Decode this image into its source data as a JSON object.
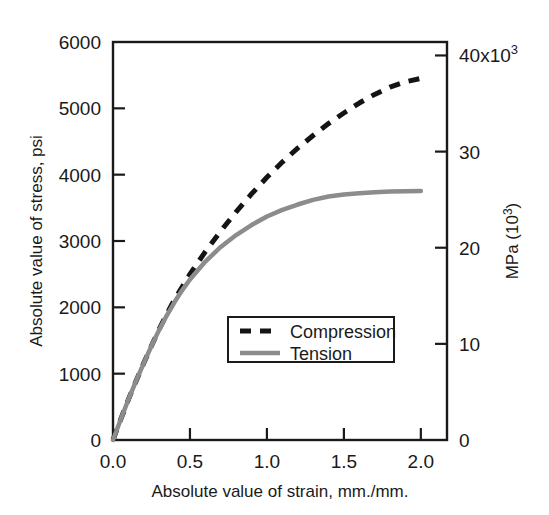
{
  "chart_data": {
    "type": "line",
    "title": "",
    "xlabel": "Absolute value of strain, mm./mm.",
    "ylabel": "Absolute value of stress, psi",
    "y2label": "MPa (10",
    "y2label_sup": "3",
    "y2label_close": ")",
    "xlim": [
      0.0,
      2.17
    ],
    "ylim": [
      0,
      6000
    ],
    "y2lim": [
      0,
      41.4
    ],
    "grid": false,
    "legend_position": "center",
    "xticks": [
      0.0,
      0.5,
      1.0,
      1.5,
      2.0
    ],
    "xticklabels": [
      "0.0",
      "0.5",
      "1.0",
      "1.5",
      "2.0"
    ],
    "yticks": [
      0,
      1000,
      2000,
      3000,
      4000,
      5000,
      6000
    ],
    "yticklabels": [
      "0",
      "1000",
      "2000",
      "3000",
      "4000",
      "5000",
      "6000"
    ],
    "y2ticks": [
      0,
      10,
      20,
      30,
      40
    ],
    "y2ticklabels": [
      "0",
      "10",
      "20",
      "30",
      "40x10"
    ],
    "y2tick_sup": "3",
    "series": [
      {
        "name": "Compression",
        "style": "dashed",
        "color": "#141414",
        "x": [
          0.0,
          0.05,
          0.1,
          0.15,
          0.2,
          0.25,
          0.3,
          0.35,
          0.4,
          0.45,
          0.5,
          0.6,
          0.7,
          0.8,
          0.9,
          1.0,
          1.1,
          1.2,
          1.3,
          1.4,
          1.5,
          1.6,
          1.7,
          1.8,
          1.9,
          2.0
        ],
        "y": [
          0,
          310,
          610,
          890,
          1160,
          1420,
          1670,
          1900,
          2120,
          2310,
          2500,
          2840,
          3150,
          3440,
          3710,
          3960,
          4190,
          4400,
          4590,
          4770,
          4930,
          5080,
          5210,
          5320,
          5400,
          5450
        ]
      },
      {
        "name": "Tension",
        "style": "solid",
        "color": "#8c8c8c",
        "x": [
          0.0,
          0.05,
          0.1,
          0.15,
          0.2,
          0.25,
          0.3,
          0.35,
          0.4,
          0.45,
          0.5,
          0.6,
          0.7,
          0.8,
          0.9,
          1.0,
          1.1,
          1.2,
          1.3,
          1.4,
          1.5,
          1.6,
          1.7,
          1.8,
          1.9,
          2.0
        ],
        "y": [
          0,
          310,
          610,
          890,
          1160,
          1420,
          1660,
          1880,
          2080,
          2260,
          2420,
          2690,
          2910,
          3090,
          3240,
          3370,
          3470,
          3550,
          3620,
          3670,
          3700,
          3720,
          3735,
          3745,
          3750,
          3755
        ]
      }
    ],
    "legend": [
      {
        "label": "Compression",
        "style": "dashed",
        "color": "#141414"
      },
      {
        "label": "Tension",
        "style": "solid",
        "color": "#8c8c8c"
      }
    ]
  },
  "axes": {
    "left_title": "Absolute value of stress, psi",
    "bottom_title": "Absolute value of strain, mm./mm.",
    "right_title_main": "MPa (10",
    "right_title_sup": "3",
    "right_title_tail": ")"
  },
  "colors": {
    "axis": "#1a1a1a",
    "compression": "#141414",
    "tension": "#8c8c8c",
    "background": "#ffffff"
  }
}
